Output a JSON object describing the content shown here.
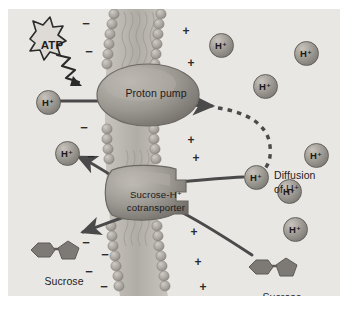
{
  "figure": {
    "background_color": "#e9e7e3",
    "panel_border_color": "#d8d5d0"
  },
  "labels": {
    "atp": "ATP",
    "proton_pump": "Proton pump",
    "cotransporter_line1": "Sucrose-H⁺",
    "cotransporter_line2": "cotransporter",
    "diffusion_line1": "Diffusion",
    "diffusion_line2": "of H⁺",
    "sucrose_left": "Sucrose",
    "sucrose_right": "Sucrose",
    "proton": "H⁺",
    "minus_sign": "−",
    "plus_sign": "+"
  },
  "colors": {
    "membrane_head": "#a9a49e",
    "membrane_tail": "#bcb8b2",
    "protein": "#8e8a86",
    "protein_light": "#b3afaa",
    "proton_sphere": "#8f8b86",
    "sucrose_shape": "#7d7974",
    "arrow": "#4a4a4a",
    "text": "#1c1c1c",
    "panel": "#e9e7e3"
  },
  "protons": [
    {
      "id": "proton-pumped-in",
      "x": 47,
      "y": 101,
      "side": "outside"
    },
    {
      "id": "proton-returning",
      "x": 66,
      "y": 152,
      "side": "outside"
    },
    {
      "id": "proton-cytosol-1",
      "x": 220,
      "y": 44,
      "side": "inside"
    },
    {
      "id": "proton-cytosol-2",
      "x": 305,
      "y": 52,
      "side": "inside"
    },
    {
      "id": "proton-cytosol-3",
      "x": 264,
      "y": 85,
      "side": "inside"
    },
    {
      "id": "proton-at-carrier",
      "x": 255,
      "y": 176,
      "side": "inside"
    },
    {
      "id": "proton-cytosol-4",
      "x": 315,
      "y": 154,
      "side": "inside"
    },
    {
      "id": "proton-cytosol-5",
      "x": 288,
      "y": 190,
      "side": "inside"
    },
    {
      "id": "proton-cytosol-6",
      "x": 294,
      "y": 228,
      "side": "inside"
    }
  ],
  "charges": {
    "minus": [
      {
        "x": 86,
        "y": 24
      },
      {
        "x": 89,
        "y": 52
      },
      {
        "x": 84,
        "y": 128
      },
      {
        "x": 91,
        "y": 157
      },
      {
        "x": 86,
        "y": 243
      },
      {
        "x": 89,
        "y": 272
      },
      {
        "x": 105,
        "y": 255
      },
      {
        "x": 104,
        "y": 287
      }
    ],
    "plus": [
      {
        "x": 186,
        "y": 31
      },
      {
        "x": 191,
        "y": 63
      },
      {
        "x": 191,
        "y": 140
      },
      {
        "x": 196,
        "y": 158
      },
      {
        "x": 194,
        "y": 232
      },
      {
        "x": 198,
        "y": 262
      },
      {
        "x": 203,
        "y": 287
      }
    ]
  },
  "sucrose_molecules": [
    {
      "id": "sucrose-left",
      "x": 52,
      "y": 250
    },
    {
      "id": "sucrose-right",
      "x": 270,
      "y": 267
    }
  ],
  "proteins": [
    {
      "id": "proton-pump",
      "label": "Proton pump",
      "cx": 148,
      "cy": 95
    },
    {
      "id": "cotransporter",
      "label": "Sucrose-H⁺ cotransporter",
      "cx": 150,
      "cy": 196
    }
  ],
  "arrows": [
    {
      "id": "arrow-proton-into-pump",
      "type": "straight",
      "from": "proton-pumped-in",
      "to": "proton-pump"
    },
    {
      "id": "arrow-pump-exit",
      "type": "straight",
      "from": "proton-pump",
      "to": "cytosol"
    },
    {
      "id": "arrow-diffusion",
      "type": "dashed-curve",
      "from": "cytosol",
      "to": "proton-at-carrier"
    },
    {
      "id": "arrow-proton-out",
      "type": "curve",
      "from": "cotransporter",
      "to": "proton-returning"
    },
    {
      "id": "arrow-sucrose-out",
      "type": "curve",
      "from": "cotransporter",
      "to": "sucrose-left"
    },
    {
      "id": "arrow-proton-in",
      "type": "curve",
      "from": "proton-at-carrier",
      "to": "cotransporter"
    },
    {
      "id": "arrow-sucrose-in",
      "type": "curve",
      "from": "sucrose-right",
      "to": "cotransporter"
    },
    {
      "id": "arrow-atp-energy",
      "type": "lightning",
      "from": "atp",
      "to": "proton-pump"
    }
  ]
}
